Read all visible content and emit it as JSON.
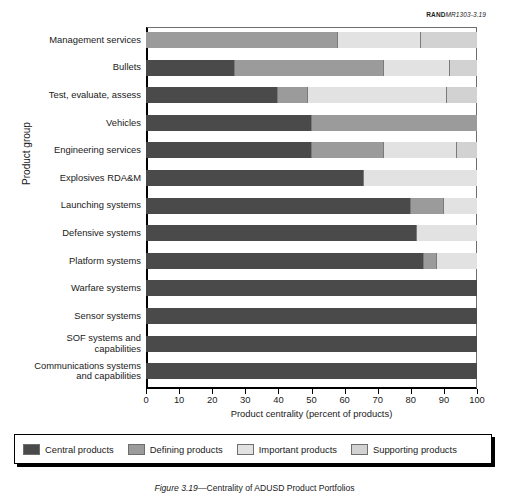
{
  "figure_id": {
    "bold_part": "RAND",
    "italic_part": "MR1303-3.19"
  },
  "caption": {
    "label": "Figure 3.19",
    "text": "Centrality of ADUSD Product Portfolios"
  },
  "colors": {
    "central": "#4a4a4a",
    "defining": "#9b9b9b",
    "important": "#e2e2e2",
    "supporting": "#d2d2d2",
    "axis": "#000000",
    "gridline": "#7a7a7a",
    "background": "#ffffff"
  },
  "legend": {
    "position": "below",
    "items": [
      {
        "label": "Central products",
        "key": "central"
      },
      {
        "label": "Defining products",
        "key": "defining"
      },
      {
        "label": "Important products",
        "key": "important"
      },
      {
        "label": "Supporting products",
        "key": "supporting"
      }
    ]
  },
  "chart_data": {
    "type": "bar",
    "orientation": "horizontal",
    "stacked": true,
    "title": "",
    "xlabel": "Product centrality (percent of products)",
    "ylabel": "Product group",
    "xlim": [
      0,
      100
    ],
    "xticks": [
      0,
      10,
      20,
      30,
      40,
      50,
      60,
      70,
      80,
      90,
      100
    ],
    "xticklabels": [
      "0",
      "10",
      "20",
      "30",
      "40",
      "50",
      "60",
      "70",
      "80",
      "90",
      "100"
    ],
    "grid": false,
    "categories": [
      "Management services",
      "Bullets",
      "Test, evaluate, assess",
      "Vehicles",
      "Engineering services",
      "Explosives RDA&M",
      "Launching systems",
      "Defensive systems",
      "Platform systems",
      "Warfare systems",
      "Sensor systems",
      "SOF systems and capabilities",
      "Communications systems and capabilities"
    ],
    "series": [
      {
        "name": "Central products",
        "key": "central",
        "values": [
          0,
          27,
          40,
          50,
          50,
          66,
          80,
          82,
          84,
          100,
          100,
          100,
          100
        ]
      },
      {
        "name": "Defining products",
        "key": "defining",
        "values": [
          58,
          45,
          9,
          50,
          22,
          0,
          10,
          0,
          4,
          0,
          0,
          0,
          0
        ]
      },
      {
        "name": "Important products",
        "key": "important",
        "values": [
          25,
          20,
          42,
          0,
          22,
          34,
          10,
          18,
          12,
          0,
          0,
          0,
          0
        ]
      },
      {
        "name": "Supporting products",
        "key": "supporting",
        "values": [
          17,
          8,
          9,
          0,
          6,
          0,
          0,
          0,
          0,
          0,
          0,
          0,
          0
        ]
      }
    ]
  }
}
